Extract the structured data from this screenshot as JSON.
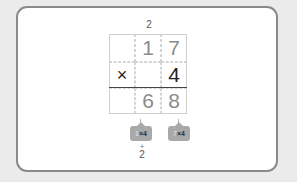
{
  "problem": {
    "carry_top": "2",
    "rows": [
      [
        "",
        "1",
        "7"
      ],
      [
        "×",
        "",
        "4"
      ],
      [
        "",
        "6",
        "8"
      ]
    ],
    "row_styles": [
      [
        "light",
        "light",
        "light"
      ],
      [
        "dark",
        "light",
        "dark"
      ],
      [
        "light",
        "light",
        "light"
      ]
    ]
  },
  "hints": [
    {
      "lead": "1",
      "rest": "×4"
    },
    {
      "lead": "7",
      "rest": "×4"
    }
  ],
  "bottom_plus": "+",
  "bottom_carry": "2"
}
